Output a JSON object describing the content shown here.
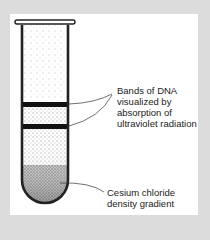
{
  "figure": {
    "background_color": "#dcdcdc",
    "panel_color": "#ffffff",
    "labels": {
      "dna_bands": "Bands of DNA\nvisualized by\nabsorption of\nultraviolet radiation",
      "gradient": "Cesium chloride\ndensity gradient"
    },
    "elements": {
      "tube": "test-tube",
      "bands": [
        "upper DNA band",
        "lower DNA band"
      ]
    }
  }
}
